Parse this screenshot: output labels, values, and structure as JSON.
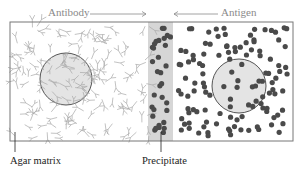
{
  "labels": {
    "antibody": "Antibody",
    "antigen": "Antigen",
    "agar_matrix": "Agar matrix",
    "precipitate": "Precipitate"
  },
  "colors": {
    "border": "#777777",
    "antibody_stroke": "#a8a8a8",
    "antigen_dot": "#4a4a4a",
    "well_fill": "#e4e4e4",
    "precipitate_band": "#d6d6d6",
    "label_top": "#8a8a8a",
    "label_bottom": "#222222"
  },
  "diagram": {
    "box": {
      "x": 10,
      "y": 22,
      "w": 283,
      "h": 119
    },
    "antibody_well": {
      "cx": 66,
      "cy": 79,
      "r": 26
    },
    "antigen_well": {
      "cx": 239,
      "cy": 86,
      "r": 27
    },
    "precipitate_band": {
      "x": 148,
      "w": 25
    },
    "arrows": [
      {
        "from": "antibody-label",
        "direction": "right"
      },
      {
        "from": "antigen-label",
        "direction": "left"
      }
    ]
  }
}
